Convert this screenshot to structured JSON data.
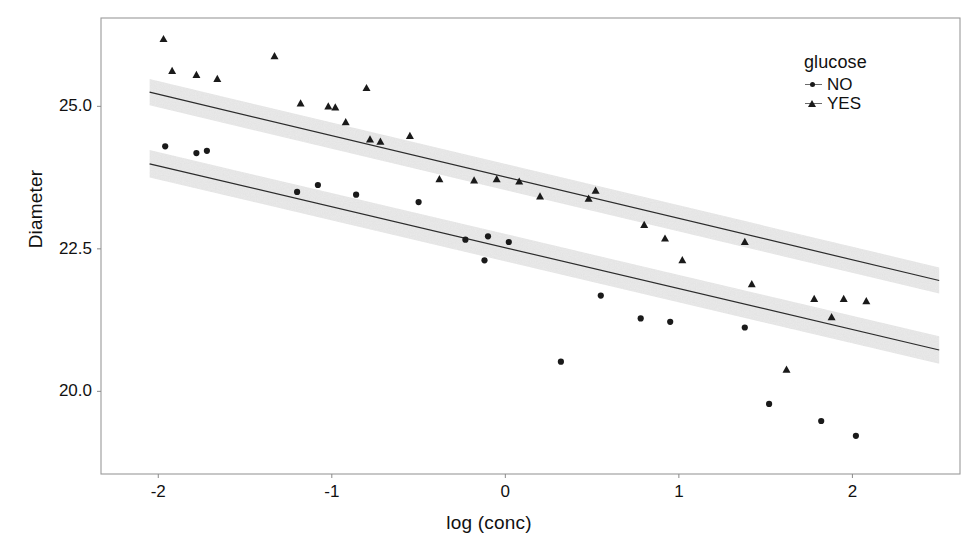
{
  "chart_data": {
    "type": "scatter",
    "title": "",
    "xlabel": "log (conc)",
    "ylabel": "Diameter",
    "xlim": [
      -2.33,
      2.62
    ],
    "ylim": [
      18.55,
      26.55
    ],
    "xticks": [
      -2,
      -1,
      0,
      1,
      2
    ],
    "xticklabels": [
      "-2",
      "-1",
      "0",
      "1",
      "2"
    ],
    "yticks": [
      20.0,
      22.5,
      25.0
    ],
    "yticklabels": [
      "20.0",
      "22.5",
      "25.0"
    ],
    "grid": false,
    "legend": {
      "title": "glucose",
      "position": "top-right",
      "entries": [
        {
          "label": "NO",
          "marker": "circle"
        },
        {
          "label": "YES",
          "marker": "triangle"
        }
      ]
    },
    "series": [
      {
        "name": "NO",
        "marker": "circle",
        "color": "#1a1a1a",
        "points": [
          {
            "x": -1.96,
            "y": 24.3
          },
          {
            "x": -1.78,
            "y": 24.18
          },
          {
            "x": -1.72,
            "y": 24.22
          },
          {
            "x": -1.2,
            "y": 23.5
          },
          {
            "x": -1.08,
            "y": 23.62
          },
          {
            "x": -0.86,
            "y": 23.45
          },
          {
            "x": -0.5,
            "y": 23.32
          },
          {
            "x": -0.23,
            "y": 22.66
          },
          {
            "x": -0.12,
            "y": 22.3
          },
          {
            "x": -0.1,
            "y": 22.72
          },
          {
            "x": 0.02,
            "y": 22.62
          },
          {
            "x": 0.32,
            "y": 20.52
          },
          {
            "x": 0.55,
            "y": 21.68
          },
          {
            "x": 0.78,
            "y": 21.28
          },
          {
            "x": 0.95,
            "y": 21.22
          },
          {
            "x": 1.38,
            "y": 21.12
          },
          {
            "x": 1.52,
            "y": 19.78
          },
          {
            "x": 1.82,
            "y": 19.48
          },
          {
            "x": 2.02,
            "y": 19.22
          }
        ]
      },
      {
        "name": "YES",
        "marker": "triangle",
        "color": "#1a1a1a",
        "points": [
          {
            "x": -1.97,
            "y": 26.18
          },
          {
            "x": -1.92,
            "y": 25.62
          },
          {
            "x": -1.78,
            "y": 25.55
          },
          {
            "x": -1.66,
            "y": 25.48
          },
          {
            "x": -1.33,
            "y": 25.88
          },
          {
            "x": -1.18,
            "y": 25.05
          },
          {
            "x": -1.02,
            "y": 25.0
          },
          {
            "x": -0.98,
            "y": 24.98
          },
          {
            "x": -0.92,
            "y": 24.72
          },
          {
            "x": -0.8,
            "y": 25.32
          },
          {
            "x": -0.78,
            "y": 24.42
          },
          {
            "x": -0.72,
            "y": 24.38
          },
          {
            "x": -0.55,
            "y": 24.48
          },
          {
            "x": -0.38,
            "y": 23.72
          },
          {
            "x": -0.18,
            "y": 23.7
          },
          {
            "x": -0.05,
            "y": 23.72
          },
          {
            "x": 0.08,
            "y": 23.68
          },
          {
            "x": 0.2,
            "y": 23.42
          },
          {
            "x": 0.48,
            "y": 23.38
          },
          {
            "x": 0.52,
            "y": 23.52
          },
          {
            "x": 0.8,
            "y": 22.92
          },
          {
            "x": 0.92,
            "y": 22.68
          },
          {
            "x": 1.02,
            "y": 22.3
          },
          {
            "x": 1.38,
            "y": 22.62
          },
          {
            "x": 1.42,
            "y": 21.88
          },
          {
            "x": 1.62,
            "y": 20.38
          },
          {
            "x": 1.78,
            "y": 21.62
          },
          {
            "x": 1.88,
            "y": 21.3
          },
          {
            "x": 1.95,
            "y": 21.62
          },
          {
            "x": 2.08,
            "y": 21.58
          }
        ]
      }
    ],
    "fits": [
      {
        "name": "YES",
        "intercept": 23.76,
        "slope": -0.726,
        "x_start": -2.05,
        "x_end": 2.5,
        "band_half_width": 0.23,
        "band_color": "#ebebeb",
        "line_color": "#2b2b2b"
      },
      {
        "name": "NO",
        "intercept": 22.52,
        "slope": -0.718,
        "x_start": -2.05,
        "x_end": 2.5,
        "band_half_width": 0.24,
        "band_color": "#ebebeb",
        "line_color": "#2b2b2b"
      }
    ]
  }
}
